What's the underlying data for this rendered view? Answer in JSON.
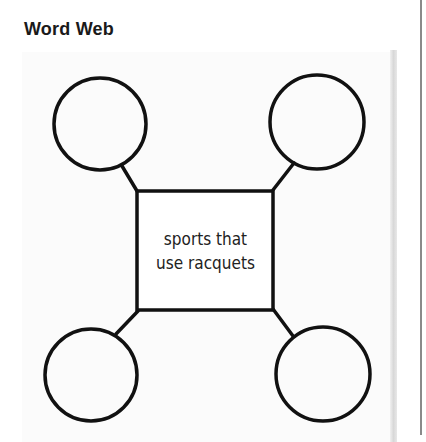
{
  "title": "Word Web",
  "center": {
    "line1": "sports that",
    "line2": "use racquets"
  },
  "nodes": [
    {
      "position": "top-left",
      "text": ""
    },
    {
      "position": "top-right",
      "text": ""
    },
    {
      "position": "bottom-left",
      "text": ""
    },
    {
      "position": "bottom-right",
      "text": ""
    }
  ],
  "colors": {
    "stroke": "#111111",
    "panel": "#fbfbfb",
    "rule": "#8a8a8a"
  }
}
